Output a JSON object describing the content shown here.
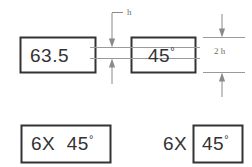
{
  "diagram": {
    "background_color": "#ffffff",
    "frame_color": "#333333",
    "dimension_color": "#8a8a8a",
    "text_color": "#3a3a3a",
    "degree_symbol": "°"
  },
  "labels": {
    "h": "h",
    "two_h": "2 h"
  },
  "frames": {
    "top_left": {
      "name": "frame-63-5",
      "value": "63.5"
    },
    "top_right": {
      "name": "frame-45-degrees",
      "value": "45",
      "suffix": "°"
    },
    "bottom_left": {
      "name": "frame-6x-45-degrees-inside",
      "value": "6X  45",
      "suffix": "°"
    },
    "bottom_right_prefix": {
      "name": "label-6x-outside",
      "value": "6X"
    },
    "bottom_right": {
      "name": "frame-45-degrees-outside-prefix",
      "value": "45",
      "suffix": "°"
    }
  }
}
